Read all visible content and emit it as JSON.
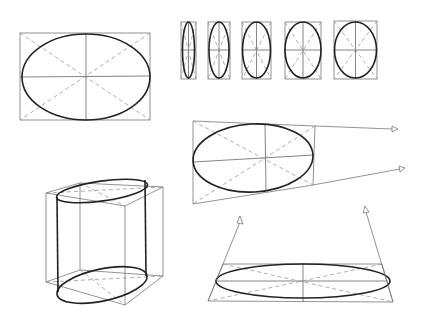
{
  "colors": {
    "ink": "#222222",
    "construction": "#777777",
    "background": "#ffffff"
  },
  "figures": {
    "front_ellipse": {
      "box": [
        20,
        33,
        150,
        120
      ],
      "cx": 86,
      "cy": 77,
      "rx": 64,
      "ry": 43
    },
    "proportion_series": [
      {
        "box": [
          181,
          22,
          196,
          79
        ],
        "cx": 188.5,
        "cy": 50,
        "rx": 6,
        "ry": 28
      },
      {
        "box": [
          208,
          22,
          230,
          79
        ],
        "cx": 219,
        "cy": 50,
        "rx": 10,
        "ry": 28
      },
      {
        "box": [
          242,
          22,
          271,
          79
        ],
        "cx": 256,
        "cy": 50,
        "rx": 14,
        "ry": 28
      },
      {
        "box": [
          285,
          22,
          321,
          79
        ],
        "cx": 303,
        "cy": 50,
        "rx": 18,
        "ry": 28
      },
      {
        "box": [
          334,
          21,
          377,
          79
        ],
        "cx": 356,
        "cy": 50,
        "rx": 21,
        "ry": 28
      }
    ],
    "perspective_ellipse": {
      "quad": [
        [
          193,
          121
        ],
        [
          315,
          126
        ],
        [
          313,
          185
        ],
        [
          193,
          204
        ]
      ],
      "cx": 265,
      "cy": 158,
      "rx": 60,
      "ry": 34,
      "vanishing_lines": [
        [
          [
            315,
            126
          ],
          [
            394,
            130
          ]
        ],
        [
          [
            313,
            185
          ],
          [
            402,
            168
          ]
        ]
      ]
    },
    "cylinder": {
      "top_quad": [
        [
          46,
          193
        ],
        [
          80,
          183
        ],
        [
          163,
          187
        ],
        [
          125,
          206
        ]
      ],
      "bottom_quad": [
        [
          46,
          282
        ],
        [
          80,
          270
        ],
        [
          163,
          276
        ],
        [
          125,
          305
        ]
      ],
      "top_ellipse": {
        "cx": 100,
        "cy": 190,
        "rx": 45,
        "ry": 10
      },
      "bottom_ellipse": {
        "cx": 102,
        "cy": 285,
        "rx": 45,
        "ry": 15
      }
    },
    "flat_ellipse": {
      "quad": [
        [
          223,
          264
        ],
        [
          382,
          264
        ],
        [
          393,
          302
        ],
        [
          208,
          301
        ]
      ],
      "cx": 303,
      "cy": 281,
      "rx": 87,
      "ry": 17,
      "vanishing_lines": [
        [
          [
            208,
            301
          ],
          [
            240,
            220
          ]
        ],
        [
          [
            393,
            302
          ],
          [
            365,
            209
          ]
        ]
      ]
    }
  }
}
